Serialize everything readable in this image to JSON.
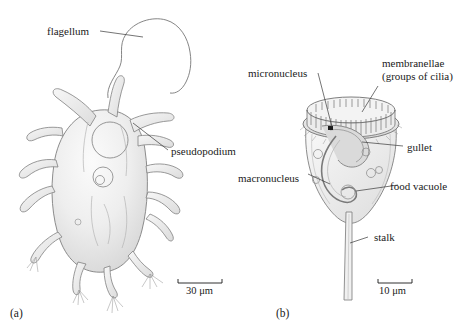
{
  "figure": {
    "background": "#ffffff",
    "ink": "#1a1a1a",
    "line_color": "#6e6e6e",
    "fill_light": "#f2f2f2",
    "fill_mid": "#e2e2e2",
    "fill_shadow": "#cfcfcf"
  },
  "panels": [
    {
      "id": "a",
      "caption": "(a)",
      "organism": "amoeboflagellate",
      "labels": [
        {
          "key": "flagellum",
          "text": "flagellum"
        },
        {
          "key": "pseudopodium",
          "text": "pseudopodium"
        }
      ],
      "scale_bar": {
        "value": "30",
        "unit": "μm",
        "text": "30 μm"
      }
    },
    {
      "id": "b",
      "caption": "(b)",
      "organism": "vorticella",
      "labels": [
        {
          "key": "micronucleus",
          "text": "micronucleus"
        },
        {
          "key": "membranellae",
          "text": "membranellae",
          "text2": "(groups of cilia)"
        },
        {
          "key": "gullet",
          "text": "gullet"
        },
        {
          "key": "macronucleus",
          "text": "macronucleus"
        },
        {
          "key": "food_vacuole",
          "text": "food vacuole"
        },
        {
          "key": "stalk",
          "text": "stalk"
        }
      ],
      "scale_bar": {
        "value": "10",
        "unit": "μm",
        "text": "10 μm"
      }
    }
  ]
}
